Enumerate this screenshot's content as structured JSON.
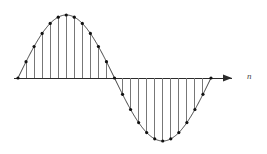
{
  "figure": {
    "background_color": "#ffffff",
    "width": 267,
    "height": 154
  },
  "axis": {
    "label": "n",
    "label_style": "italic",
    "axis_color": "#2b2b2b",
    "baseline_y": 78,
    "x_start": 14,
    "x_end": 232,
    "arrow_head": "right-arrow-icon"
  },
  "style": {
    "curve_color": "#3a3a3a",
    "stem_color": "#777777",
    "marker_color": "#111111",
    "marker_radius": 1.6,
    "stem_width": 1,
    "curve_width": 1
  },
  "chart_data": {
    "type": "line",
    "xlabel": "n",
    "ylabel": "",
    "grid": false,
    "legend": "none",
    "xlim": [
      0,
      24
    ],
    "ylim": [
      -1,
      1
    ],
    "categories": [
      0,
      1,
      2,
      3,
      4,
      5,
      6,
      7,
      8,
      9,
      10,
      11,
      12,
      13,
      14,
      15,
      16,
      17,
      18,
      19,
      20,
      21,
      22,
      23,
      24
    ],
    "series": [
      {
        "name": "x[n] = sin(2*pi*n/24)",
        "values": [
          0.0,
          0.259,
          0.5,
          0.707,
          0.866,
          0.966,
          1.0,
          0.966,
          0.866,
          0.707,
          0.5,
          0.259,
          0.0,
          -0.259,
          -0.5,
          -0.707,
          -0.866,
          -0.966,
          -1.0,
          -0.966,
          -0.866,
          -0.707,
          -0.5,
          -0.259,
          0.0
        ]
      }
    ],
    "envelope": {
      "name": "continuous sinusoid envelope",
      "samples_per_period": 24,
      "amplitude": 1.0,
      "periods": 1.0
    },
    "pixel_geometry": {
      "baseline_y": 78,
      "x_first_sample": 18,
      "x_last_sample": 211,
      "peak_pixel": [
        68,
        15
      ],
      "trough_pixel": [
        160,
        141
      ],
      "zero_crossing_pixel_x": 114
    }
  }
}
